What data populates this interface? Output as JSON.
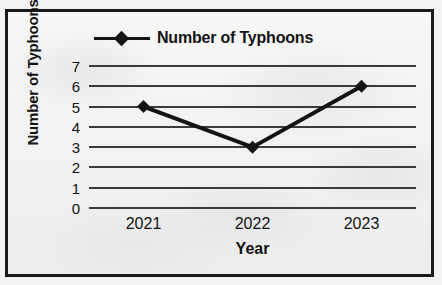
{
  "chart_data": {
    "type": "line",
    "title": "",
    "categories": [
      "2021",
      "2022",
      "2023"
    ],
    "values": [
      5,
      3,
      6
    ],
    "series": [
      {
        "name": "Number of Typhoons",
        "values": [
          5,
          3,
          6
        ]
      }
    ],
    "xlabel": "Year",
    "ylabel": "Number of Typhoons",
    "ylim": [
      0,
      7
    ],
    "yticks": [
      7,
      6,
      5,
      4,
      3,
      2,
      1,
      0
    ],
    "grid": "horizontal",
    "legend_position": "top",
    "legend_entries": [
      "Number of Typhoons"
    ],
    "marker": "diamond",
    "line_color": "#141414",
    "marker_color": "#141414",
    "grid_color": "#3a3a3a",
    "background_color": "#f4f4f3",
    "border_color": "#1a1a1a"
  }
}
